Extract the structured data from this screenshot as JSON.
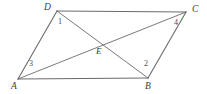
{
  "figure": {
    "kind": "geometry-diagram",
    "shape_name": "parallelogram",
    "background_color": "#ffffff",
    "stroke_color": "#6b6b6b",
    "stroke_width": 1,
    "label_color": "#3d3d3d",
    "width": 207,
    "height": 94,
    "vertices": [
      {
        "id": "A",
        "label": "A",
        "x": 18,
        "y": 79,
        "label_x": 11,
        "label_y": 82
      },
      {
        "id": "B",
        "label": "B",
        "x": 148,
        "y": 78,
        "label_x": 145,
        "label_y": 82
      },
      {
        "id": "C",
        "label": "C",
        "x": 186,
        "y": 12,
        "label_x": 192,
        "label_y": 5
      },
      {
        "id": "D",
        "label": "D",
        "x": 57,
        "y": 11,
        "label_x": 44,
        "label_y": 3
      },
      {
        "id": "E",
        "label": "E",
        "x": 100,
        "y": 43,
        "label_x": 96,
        "label_y": 47
      }
    ],
    "sides": [
      {
        "name": "AB",
        "from": "A",
        "to": "B"
      },
      {
        "name": "BC",
        "from": "B",
        "to": "C"
      },
      {
        "name": "CD",
        "from": "C",
        "to": "D"
      },
      {
        "name": "DA",
        "from": "D",
        "to": "A"
      }
    ],
    "diagonals": [
      {
        "name": "AC",
        "from": "A",
        "to": "C"
      },
      {
        "name": "BD",
        "from": "B",
        "to": "D"
      }
    ],
    "angle_labels": [
      {
        "id": "1",
        "label": "1",
        "at_vertex": "D",
        "x": 58,
        "y": 18
      },
      {
        "id": "2",
        "label": "2",
        "at_vertex": "B",
        "x": 144,
        "y": 60
      },
      {
        "id": "3",
        "label": "3",
        "at_vertex": "A",
        "x": 29,
        "y": 60
      },
      {
        "id": "4",
        "label": "4",
        "at_vertex": "C",
        "x": 174,
        "y": 19
      }
    ]
  }
}
